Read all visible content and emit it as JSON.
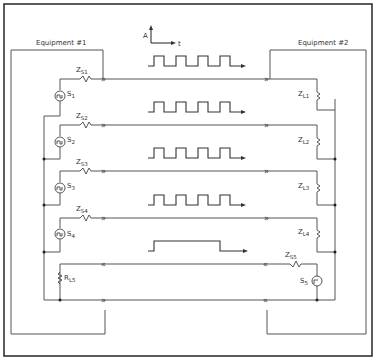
{
  "equipment": {
    "left_label": "Equipment #1",
    "right_label": "Equipment #2"
  },
  "axes_legend": {
    "y_label": "A",
    "x_label": "t"
  },
  "channels": [
    {
      "source": "S",
      "source_sub": "1",
      "zs": "Z",
      "zs_sub": "S1",
      "zl": "Z",
      "zl_sub": "L1",
      "waveform": "square-pulse-train",
      "pulses": 4
    },
    {
      "source": "S",
      "source_sub": "2",
      "zs": "Z",
      "zs_sub": "S2",
      "zl": "Z",
      "zl_sub": "L2",
      "waveform": "square-pulse-train",
      "pulses": 4
    },
    {
      "source": "S",
      "source_sub": "3",
      "zs": "Z",
      "zs_sub": "S3",
      "zl": "Z",
      "zl_sub": "L3",
      "waveform": "square-pulse-train",
      "pulses": 4
    },
    {
      "source": "S",
      "source_sub": "4",
      "zs": "Z",
      "zs_sub": "S4",
      "zl": "Z",
      "zl_sub": "L4",
      "waveform": "square-pulse-train",
      "pulses": 4
    },
    {
      "source": "S",
      "source_sub": "5",
      "zs": "Z",
      "zs_sub": "S5",
      "zl": "R",
      "zl_sub": "L5",
      "waveform": "single-long-pulse",
      "pulses": 1,
      "direction": "reverse"
    }
  ],
  "colors": {
    "line": "#555555",
    "frame": "#333333",
    "background": "#ffffff"
  }
}
